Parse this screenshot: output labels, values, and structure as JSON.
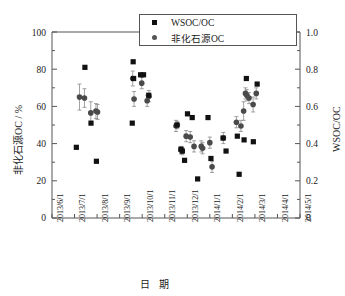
{
  "chart_data": {
    "type": "scatter",
    "title": "",
    "xlabel": "日 期",
    "ylabel": "非化石源OC / %",
    "y2label": "WSOC/OC",
    "ylim": [
      0,
      100
    ],
    "y2lim": [
      0,
      1.0
    ],
    "yticks": [
      "0",
      "20",
      "40",
      "60",
      "80",
      "100"
    ],
    "y2ticks": [
      "0",
      "0.2",
      "0.4",
      "0.6",
      "0.8",
      "1.0"
    ],
    "grid": false,
    "legend_position": "top-center",
    "xticks": [
      "2013/6/1",
      "2013/7/1",
      "2013/8/1",
      "2013/9/1",
      "2013/10/1",
      "2013/11/1",
      "2013/12/1",
      "2014/1/1",
      "2014/2/1",
      "2014/3/1",
      "2014/4/1",
      "2014/5/1"
    ],
    "xlim": [
      "2013/6/1",
      "2014/5/1"
    ],
    "series": [
      {
        "name": "WSOC/OC",
        "marker": "square",
        "color": "#111111",
        "axis": "right",
        "points": [
          {
            "x": 1.08,
            "y": 0.38
          },
          {
            "x": 1.46,
            "y": 0.81
          },
          {
            "x": 1.73,
            "y": 0.51
          },
          {
            "x": 1.97,
            "y": 0.305
          },
          {
            "x": 3.56,
            "y": 0.51
          },
          {
            "x": 3.6,
            "y": 0.84
          },
          {
            "x": 3.62,
            "y": 0.75
          },
          {
            "x": 3.93,
            "y": 0.77
          },
          {
            "x": 4.06,
            "y": 0.77
          },
          {
            "x": 4.29,
            "y": 0.66
          },
          {
            "x": 5.54,
            "y": 0.5
          },
          {
            "x": 5.72,
            "y": 0.37
          },
          {
            "x": 5.78,
            "y": 0.36
          },
          {
            "x": 5.88,
            "y": 0.31
          },
          {
            "x": 6.01,
            "y": 0.56
          },
          {
            "x": 6.22,
            "y": 0.54
          },
          {
            "x": 6.46,
            "y": 0.21
          },
          {
            "x": 6.92,
            "y": 0.54
          },
          {
            "x": 7.05,
            "y": 0.32
          },
          {
            "x": 7.59,
            "y": 0.43
          },
          {
            "x": 7.72,
            "y": 0.36
          },
          {
            "x": 8.22,
            "y": 0.44
          },
          {
            "x": 8.3,
            "y": 0.235
          },
          {
            "x": 8.52,
            "y": 0.42
          },
          {
            "x": 8.62,
            "y": 0.75
          },
          {
            "x": 8.93,
            "y": 0.41
          },
          {
            "x": 9.1,
            "y": 0.72
          }
        ]
      },
      {
        "name": "非化石源OC",
        "marker": "circle",
        "color": "#4a4a4a",
        "axis": "left",
        "points": [
          {
            "x": 1.22,
            "y": 65,
            "err": 7
          },
          {
            "x": 1.44,
            "y": 64.5,
            "err": 5
          },
          {
            "x": 1.72,
            "y": 56.5,
            "err": 6
          },
          {
            "x": 1.95,
            "y": 57.5,
            "err": 4
          },
          {
            "x": 2.02,
            "y": 57,
            "err": 4
          },
          {
            "x": 3.58,
            "y": 75,
            "err": 4
          },
          {
            "x": 3.64,
            "y": 64,
            "err": 4
          },
          {
            "x": 3.98,
            "y": 72.5,
            "err": 3
          },
          {
            "x": 4.22,
            "y": 63,
            "err": 3
          },
          {
            "x": 4.3,
            "y": 65.5,
            "err": 3
          },
          {
            "x": 5.5,
            "y": 49.5,
            "err": 3
          },
          {
            "x": 5.56,
            "y": 50,
            "err": 2
          },
          {
            "x": 5.72,
            "y": 36.5,
            "err": 2
          },
          {
            "x": 5.78,
            "y": 36,
            "err": 2
          },
          {
            "x": 5.95,
            "y": 44,
            "err": 3
          },
          {
            "x": 6.13,
            "y": 43.5,
            "err": 3
          },
          {
            "x": 6.3,
            "y": 38.5,
            "err": 3
          },
          {
            "x": 6.62,
            "y": 38.5,
            "err": 3
          },
          {
            "x": 6.68,
            "y": 37.5,
            "err": 3
          },
          {
            "x": 7.0,
            "y": 40.5,
            "err": 3
          },
          {
            "x": 7.1,
            "y": 27.5,
            "err": 3
          },
          {
            "x": 7.6,
            "y": 43,
            "err": 3
          },
          {
            "x": 8.18,
            "y": 51.5,
            "err": 3
          },
          {
            "x": 8.38,
            "y": 49.5,
            "err": 3
          },
          {
            "x": 8.5,
            "y": 57.5,
            "err": 5
          },
          {
            "x": 8.58,
            "y": 67,
            "err": 3
          },
          {
            "x": 8.64,
            "y": 66,
            "err": 3
          },
          {
            "x": 8.74,
            "y": 64.5,
            "err": 3
          },
          {
            "x": 8.92,
            "y": 61,
            "err": 4
          },
          {
            "x": 9.06,
            "y": 67,
            "err": 3
          }
        ]
      }
    ]
  },
  "legend": {
    "entries": [
      {
        "label": "WSOC/OC",
        "marker": "square-marker-icon"
      },
      {
        "label": "非化石源OC",
        "marker": "circle-marker-icon"
      }
    ]
  }
}
